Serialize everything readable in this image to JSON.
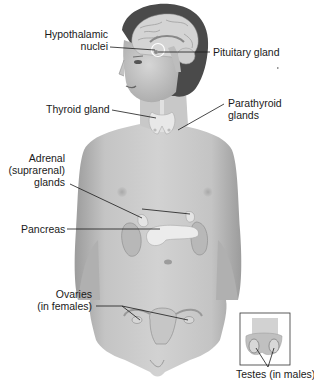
{
  "diagram": {
    "labels": {
      "hypothalamic_nuclei": [
        "Hypothalamic",
        "nuclei"
      ],
      "pituitary_gland": "Pituitary gland",
      "thyroid_gland": "Thyroid gland",
      "parathyroid_glands": [
        "Parathyroid",
        "glands"
      ],
      "adrenal_glands": [
        "Adrenal",
        "(suprarenal)",
        "glands"
      ],
      "pancreas": "Pancreas",
      "ovaries": [
        "Ovaries",
        "(in females)"
      ],
      "testes": "Testes (in males)"
    },
    "colors": {
      "skin": "#c9c9c9",
      "skin_dark": "#9a9a9a",
      "hair": "#4a4a4a",
      "brain": "#d8d8d8",
      "gland": "#e6e6e6",
      "leader": "#1a1a1a",
      "inset_border": "#333333"
    }
  }
}
